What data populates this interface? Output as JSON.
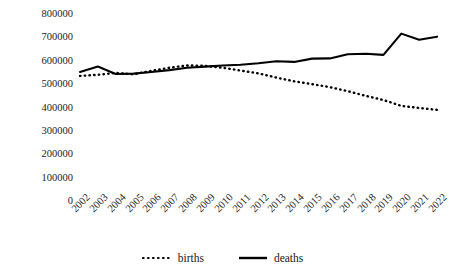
{
  "chart_data": {
    "type": "line",
    "title": "",
    "xlabel": "",
    "ylabel": "",
    "ylim": [
      0,
      800000
    ],
    "ytick_step": 100000,
    "yticks": [
      "800000",
      "700000",
      "600000",
      "500000",
      "400000",
      "300000",
      "200000",
      "100000",
      "0"
    ],
    "grid": false,
    "legend_position": "bottom-center",
    "categories": [
      "2002",
      "2003",
      "2004",
      "2005",
      "2006",
      "2007",
      "2008",
      "2009",
      "2010",
      "2011",
      "2012",
      "2013",
      "2014",
      "2015",
      "2016",
      "2017",
      "2018",
      "2019",
      "2020",
      "2021",
      "2022"
    ],
    "series": [
      {
        "name": "births",
        "style": "dotted",
        "color": "#000000",
        "values": [
          535000,
          540000,
          548000,
          542000,
          557000,
          570000,
          580000,
          578000,
          570000,
          558000,
          546000,
          528000,
          512000,
          500000,
          487000,
          470000,
          450000,
          432000,
          407000,
          398000,
          390000
        ]
      },
      {
        "name": "deaths",
        "style": "solid",
        "color": "#000000",
        "values": [
          552000,
          575000,
          543000,
          545000,
          552000,
          560000,
          570000,
          575000,
          580000,
          583000,
          589000,
          598000,
          595000,
          609000,
          610000,
          628000,
          630000,
          625000,
          716000,
          690000,
          703000
        ]
      }
    ]
  },
  "legend": {
    "items": [
      {
        "label": "births",
        "icon": "dotted-line-swatch"
      },
      {
        "label": "deaths",
        "icon": "solid-line-swatch"
      }
    ]
  }
}
